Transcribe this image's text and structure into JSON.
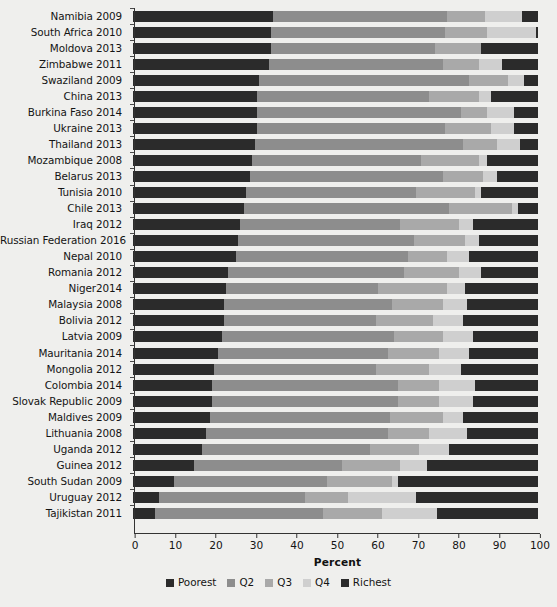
{
  "chart_data": {
    "type": "bar",
    "orientation": "horizontal",
    "stacked": true,
    "stacked_percent": true,
    "title": "",
    "xlabel": "Percent",
    "ylabel": "",
    "xlim": [
      0,
      100
    ],
    "xticks": [
      0,
      10,
      20,
      30,
      40,
      50,
      60,
      70,
      80,
      90,
      100
    ],
    "xtick_labels": [
      "0",
      "10",
      "20",
      "30",
      "40",
      "50",
      "60",
      "70",
      "80",
      "90",
      "100"
    ],
    "grid": false,
    "legend_position": "bottom",
    "legend": [
      "Poorest",
      "Q2",
      "Q3",
      "Q4",
      "Richest"
    ],
    "series_colors": [
      "#2b2b2b",
      "#8d8d8d",
      "#a9a9a9",
      "#cfcfcf",
      "#2b2b2b"
    ],
    "categories": [
      "Namibia 2009",
      "South Africa 2010",
      "Moldova 2013",
      "Zimbabwe 2011",
      "Swaziland 2009",
      "China 2013",
      "Burkina Faso 2014",
      "Ukraine 2013",
      "Thailand 2013",
      "Mozambique 2008",
      "Belarus 2013",
      "Tunisia 2010",
      "Chile 2013",
      "Iraq 2012",
      "Russian Federation 2016",
      "Nepal 2010",
      "Romania 2012",
      "Niger2014",
      "Malaysia 2008",
      "Bolivia 2012",
      "Latvia 2009",
      "Mauritania 2014",
      "Mongolia 2012",
      "Colombia 2014",
      "Slovak Republic 2009",
      "Maldives 2009",
      "Lithuania 2008",
      "Uganda 2012",
      "Guinea 2012",
      "South Sudan 2009",
      "Uruguay 2012",
      "Tajikistan 2011"
    ],
    "series": [
      {
        "name": "Poorest",
        "values": [
          34.5,
          34.0,
          34.0,
          33.5,
          31.0,
          30.5,
          30.5,
          30.5,
          30.0,
          29.5,
          29.0,
          28.0,
          27.5,
          26.5,
          26.0,
          25.5,
          23.5,
          23.0,
          22.5,
          22.5,
          22.0,
          21.0,
          20.0,
          19.5,
          19.5,
          19.0,
          18.0,
          17.0,
          15.0,
          10.0,
          6.5,
          5.5
        ]
      },
      {
        "name": "Q2",
        "values": [
          43.0,
          43.0,
          40.5,
          43.0,
          52.0,
          42.5,
          50.5,
          46.5,
          51.5,
          41.5,
          47.5,
          42.0,
          50.5,
          39.5,
          43.5,
          42.5,
          43.5,
          37.5,
          41.5,
          37.5,
          42.5,
          42.0,
          40.0,
          46.0,
          46.0,
          44.5,
          45.0,
          41.5,
          36.5,
          38.0,
          36.0,
          41.5
        ]
      },
      {
        "name": "Q3",
        "values": [
          9.5,
          10.5,
          11.5,
          9.0,
          9.5,
          12.5,
          6.5,
          11.5,
          8.5,
          14.5,
          10.0,
          14.5,
          15.5,
          14.5,
          12.5,
          9.5,
          13.5,
          17.0,
          12.5,
          14.0,
          12.0,
          12.5,
          13.0,
          10.0,
          10.0,
          13.0,
          10.0,
          12.0,
          14.5,
          16.0,
          10.5,
          14.5
        ]
      },
      {
        "name": "Q4",
        "values": [
          9.0,
          12.0,
          0.0,
          5.5,
          4.0,
          3.0,
          6.5,
          5.5,
          5.5,
          2.0,
          3.5,
          1.5,
          1.5,
          3.5,
          3.5,
          5.5,
          5.5,
          4.5,
          6.0,
          7.5,
          7.5,
          7.5,
          8.0,
          9.0,
          8.5,
          5.0,
          9.5,
          7.5,
          6.5,
          1.5,
          17.0,
          13.5
        ]
      },
      {
        "name": "Richest",
        "values": [
          4.0,
          0.5,
          14.0,
          9.0,
          3.5,
          11.5,
          6.0,
          6.0,
          4.5,
          12.5,
          10.0,
          14.0,
          5.0,
          16.0,
          14.5,
          17.0,
          14.0,
          18.0,
          17.5,
          18.5,
          16.0,
          17.0,
          19.0,
          15.5,
          16.0,
          18.5,
          17.5,
          22.0,
          27.5,
          34.5,
          30.0,
          25.0
        ]
      }
    ]
  }
}
